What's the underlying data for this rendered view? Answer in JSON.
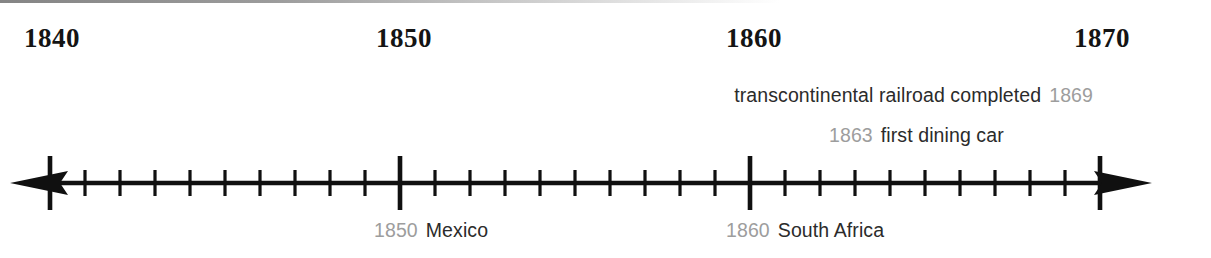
{
  "diagram": {
    "type": "timeline",
    "title": "",
    "axis": {
      "start_year": 1838,
      "end_year": 1871,
      "major_ticks": [
        {
          "year": 1840,
          "label": "1840"
        },
        {
          "year": 1850,
          "label": "1850"
        },
        {
          "year": 1860,
          "label": "1860"
        },
        {
          "year": 1870,
          "label": "1870"
        }
      ],
      "minor_tick_interval_years": 1,
      "arrowheads": "both",
      "line_color": "#101010"
    },
    "events_above": [
      {
        "year": "1869",
        "label": "transcontinental railroad completed",
        "order": "label-then-year",
        "align": "right"
      },
      {
        "year": "1863",
        "label": "first dining car",
        "order": "year-then-label",
        "align": "left"
      }
    ],
    "events_below": [
      {
        "year": "1850",
        "label": "Mexico",
        "order": "year-then-label",
        "align": "left"
      },
      {
        "year": "1860",
        "label": "South Africa",
        "order": "year-then-label",
        "align": "left"
      }
    ],
    "colors": {
      "text": "#2b2b2b",
      "year_gray": "#9d9d9d",
      "decade_label": "#141414",
      "background": "#ffffff"
    }
  }
}
